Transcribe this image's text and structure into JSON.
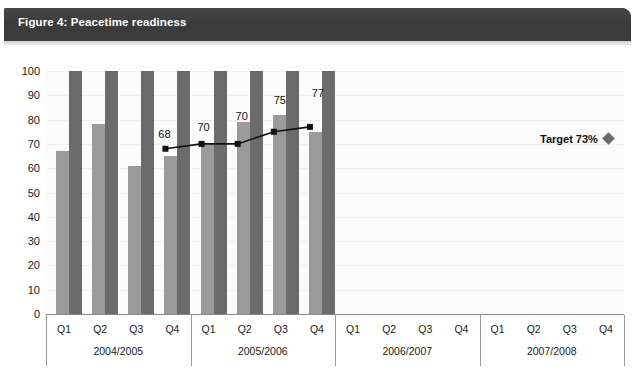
{
  "figure": {
    "title": "Figure 4: Peacetime readiness"
  },
  "chart_data": {
    "type": "bar",
    "title": "Figure 4: Peacetime readiness",
    "xlabel": "",
    "ylabel": "",
    "ylim": [
      0,
      100
    ],
    "ytick_step": 10,
    "yticks": [
      "100",
      "90",
      "80",
      "70",
      "60",
      "50",
      "40",
      "30",
      "20",
      "10",
      "0"
    ],
    "grid": true,
    "legend_position": "none",
    "categories": [
      "Q1",
      "Q2",
      "Q3",
      "Q4",
      "Q1",
      "Q2",
      "Q3",
      "Q4",
      "Q1",
      "Q2",
      "Q3",
      "Q4",
      "Q1",
      "Q2",
      "Q3",
      "Q4"
    ],
    "group_labels": [
      "2004/2005",
      "2005/2006",
      "2006/2007",
      "2007/2008"
    ],
    "series": [
      {
        "name": "light-bar",
        "color": "#9a9a9a",
        "values": [
          67,
          78,
          61,
          65,
          70,
          79,
          82,
          75,
          null,
          null,
          null,
          null,
          null,
          null,
          null,
          null
        ]
      },
      {
        "name": "dark-bar",
        "color": "#6b6b6b",
        "values": [
          100,
          100,
          100,
          100,
          100,
          100,
          100,
          100,
          null,
          null,
          null,
          null,
          null,
          null,
          null,
          null
        ]
      }
    ],
    "line_series": {
      "name": "readiness-trend",
      "color": "#111111",
      "x_indices": [
        3,
        4,
        5,
        6,
        7
      ],
      "values": [
        68,
        70,
        70,
        75,
        77
      ],
      "labels": [
        "68",
        "70",
        "70",
        "75",
        "77"
      ]
    },
    "annotations": [
      {
        "name": "target",
        "label": "Target 73%",
        "value": 73,
        "marker": "diamond",
        "color": "#6b6b6b"
      }
    ]
  },
  "axis": {
    "quarters": [
      "Q1",
      "Q2",
      "Q3",
      "Q4",
      "Q1",
      "Q2",
      "Q3",
      "Q4",
      "Q1",
      "Q2",
      "Q3",
      "Q4",
      "Q1",
      "Q2",
      "Q3",
      "Q4"
    ],
    "fiscal_years": [
      "2004/2005",
      "2005/2006",
      "2006/2007",
      "2007/2008"
    ]
  },
  "target": {
    "label": "Target 73%"
  }
}
